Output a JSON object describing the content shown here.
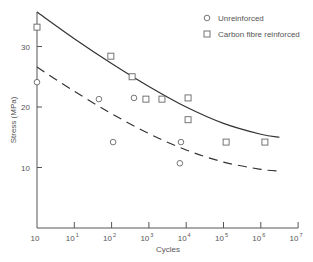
{
  "chart_data": {
    "type": "scatter",
    "title": "",
    "xlabel": "Cycles",
    "ylabel": "Stress (MPa)",
    "x_scale": "log",
    "x_ticks": [
      {
        "base": "10",
        "exp": ""
      },
      {
        "base": "10",
        "exp": "1"
      },
      {
        "base": "10",
        "exp": "2"
      },
      {
        "base": "10",
        "exp": "3"
      },
      {
        "base": "10",
        "exp": "4"
      },
      {
        "base": "10",
        "exp": "5"
      },
      {
        "base": "10",
        "exp": "6"
      },
      {
        "base": "10",
        "exp": "7"
      }
    ],
    "x_range_decades": [
      0,
      7
    ],
    "y_ticks": [
      10,
      20,
      30
    ],
    "ylim": [
      0,
      36
    ],
    "grid": false,
    "legend_position": "top-right",
    "series": [
      {
        "name": "Unreinforced",
        "marker": "circle",
        "points": [
          {
            "log_cycles": 0.0,
            "stress": 24.1
          },
          {
            "log_cycles": 1.66,
            "stress": 21.3
          },
          {
            "log_cycles": 2.04,
            "stress": 14.2
          },
          {
            "log_cycles": 2.6,
            "stress": 21.5
          },
          {
            "log_cycles": 3.86,
            "stress": 14.2
          },
          {
            "log_cycles": 3.83,
            "stress": 10.7
          }
        ],
        "fit_line": {
          "style": "dashed",
          "points": [
            {
              "log_cycles": 0.0,
              "stress": 26.6
            },
            {
              "log_cycles": 1.0,
              "stress": 22.6
            },
            {
              "log_cycles": 2.0,
              "stress": 18.9
            },
            {
              "log_cycles": 3.0,
              "stress": 15.6
            },
            {
              "log_cycles": 4.0,
              "stress": 12.9
            },
            {
              "log_cycles": 5.0,
              "stress": 10.9
            },
            {
              "log_cycles": 6.0,
              "stress": 9.7
            },
            {
              "log_cycles": 6.5,
              "stress": 9.4
            }
          ]
        }
      },
      {
        "name": "Carbon fibre reinforced",
        "marker": "square",
        "points": [
          {
            "log_cycles": 0.0,
            "stress": 33.2
          },
          {
            "log_cycles": 1.98,
            "stress": 28.4
          },
          {
            "log_cycles": 2.55,
            "stress": 25.0
          },
          {
            "log_cycles": 2.92,
            "stress": 21.3
          },
          {
            "log_cycles": 3.35,
            "stress": 21.3
          },
          {
            "log_cycles": 4.05,
            "stress": 21.5
          },
          {
            "log_cycles": 4.05,
            "stress": 17.9
          },
          {
            "log_cycles": 5.07,
            "stress": 14.2
          },
          {
            "log_cycles": 6.11,
            "stress": 14.2
          }
        ],
        "fit_line": {
          "style": "solid",
          "points": [
            {
              "log_cycles": 0.0,
              "stress": 35.7
            },
            {
              "log_cycles": 1.0,
              "stress": 31.3
            },
            {
              "log_cycles": 2.0,
              "stress": 27.2
            },
            {
              "log_cycles": 3.0,
              "stress": 23.4
            },
            {
              "log_cycles": 4.0,
              "stress": 20.0
            },
            {
              "log_cycles": 5.0,
              "stress": 17.3
            },
            {
              "log_cycles": 6.0,
              "stress": 15.5
            },
            {
              "log_cycles": 6.5,
              "stress": 15.0
            }
          ]
        }
      }
    ]
  },
  "colors": {
    "axis": "#555555",
    "line": "#333333",
    "marker": "#666666",
    "text": "#555555"
  }
}
